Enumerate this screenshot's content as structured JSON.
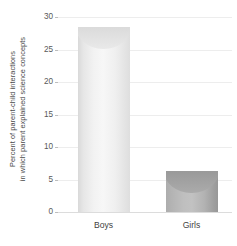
{
  "chart_data": {
    "type": "bar",
    "title": "",
    "subtitle": "",
    "xlabel": "",
    "ylabel_lines": [
      "Percent of parent-child interactions",
      "in which parent explained science concepts"
    ],
    "ylabel": "Percent of parent-child interactions in which parent explained science concepts",
    "categories": [
      "Boys",
      "Girls"
    ],
    "values": [
      28.5,
      6.3
    ],
    "ylim": [
      0,
      30
    ],
    "ytick_labels": [
      "0",
      "5",
      "10",
      "15",
      "20",
      "25",
      "30"
    ],
    "ytick_values": [
      0,
      5,
      10,
      15,
      20,
      25,
      30
    ],
    "grid": true,
    "legend": "none",
    "bar_style": "3d-cylinder",
    "bar_colors": [
      "#f2f2f2",
      "#b8b8b8"
    ],
    "gridline_color": "#ededed",
    "axis_color": "#dcdcdc",
    "text_color": "#4a4a4a",
    "background": "#ffffff"
  }
}
